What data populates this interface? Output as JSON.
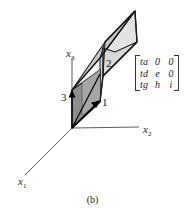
{
  "figure": {
    "caption": "(b)",
    "axes": {
      "x1": {
        "name": "x",
        "sub": "1"
      },
      "x2": {
        "name": "x",
        "sub": "2"
      },
      "x3": {
        "name": "x",
        "sub": "3"
      }
    },
    "vector_labels": [
      "1",
      "2",
      "3"
    ],
    "matrix": {
      "rows": [
        [
          "ta",
          "0",
          "0"
        ],
        [
          "td",
          "e",
          "0"
        ],
        [
          "tg",
          "h",
          "i"
        ]
      ]
    },
    "colors": {
      "line": "#1a1a1a",
      "axis": "#333333",
      "dark_face": "#8c8c8c",
      "mid_face": "#b5b5b5",
      "light_face": "#dedede"
    }
  }
}
